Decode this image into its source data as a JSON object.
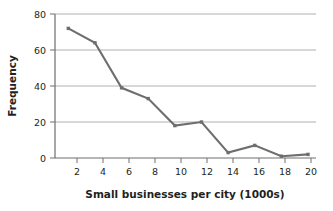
{
  "chart_data": {
    "type": "line",
    "title": "",
    "xlabel": "Small businesses per city (1000s)",
    "ylabel": "Frequency",
    "x": [
      2,
      4,
      6,
      8,
      10,
      12,
      14,
      16,
      18,
      20
    ],
    "values": [
      72,
      64,
      39,
      33,
      18,
      20,
      3,
      7,
      1,
      2
    ],
    "series": [
      {
        "name": "Frequency",
        "values": [
          72,
          64,
          39,
          33,
          18,
          20,
          3,
          7,
          1,
          2
        ]
      }
    ],
    "xticklabels": [
      "2",
      "4",
      "6",
      "8",
      "10",
      "12",
      "14",
      "16",
      "18",
      "20"
    ],
    "yticklabels": [
      "0",
      "20",
      "40",
      "60",
      "80"
    ],
    "yticks": [
      0,
      20,
      40,
      60,
      80
    ],
    "xlim": [
      1,
      20.6
    ],
    "ylim": [
      0,
      80
    ],
    "grid": "horizontal",
    "legend": "none",
    "line_color": "#6e6e6e",
    "marker": "square",
    "marker_color": "#6e6e6e",
    "grid_color": "#b0b0b0",
    "axis_color": "#6e6e6e",
    "text_color": "#231f20",
    "background": "#ffffff"
  }
}
